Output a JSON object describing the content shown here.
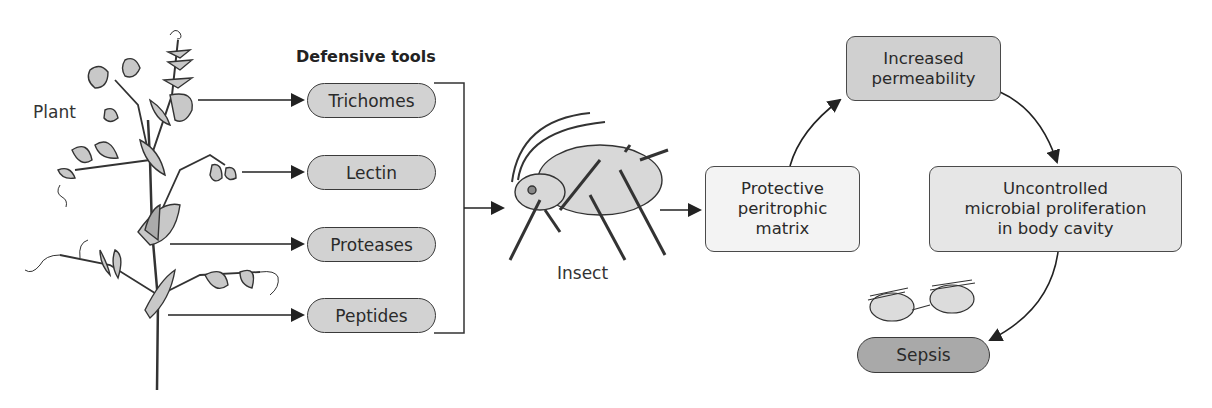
{
  "labels": {
    "plant": "Plant",
    "defensive_tools_heading": "Defensive tools",
    "insect": "Insect"
  },
  "defensive_tools": [
    {
      "label": "Trichomes"
    },
    {
      "label": "Lectin"
    },
    {
      "label": "Proteases"
    },
    {
      "label": "Peptides"
    }
  ],
  "cycle": {
    "protective": "Protective\nperitrophic\nmatrix",
    "permeability": "Increased\npermeability",
    "proliferation": "Uncontrolled\nmicrobial proliferation\nin body cavity",
    "sepsis": "Sepsis"
  },
  "colors": {
    "pill_fill": "#d2d2d2",
    "protective_fill": "#f3f3f3",
    "permeability_fill": "#d0d0d0",
    "proliferation_fill": "#e6e6e6",
    "sepsis_fill": "#a9a9a9",
    "stroke": "#333333"
  }
}
